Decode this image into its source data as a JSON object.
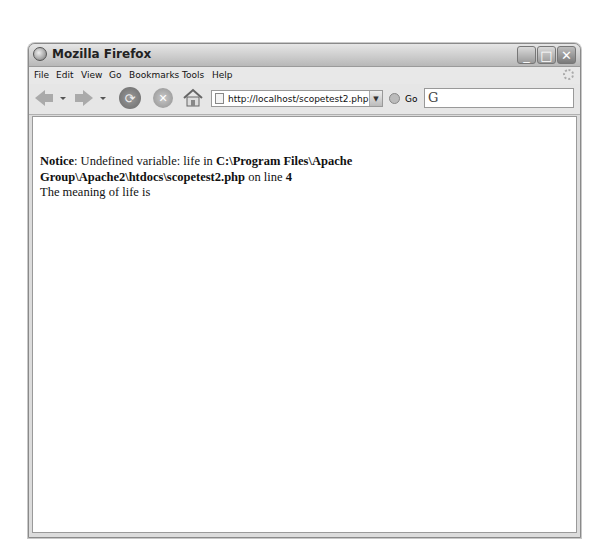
{
  "window": {
    "title": "Mozilla Firefox",
    "controls": {
      "minimize": "_",
      "maximize": "□",
      "close": "✕"
    }
  },
  "menubar": {
    "items": [
      "File",
      "Edit",
      "View",
      "Go",
      "Bookmarks",
      "Tools",
      "Help"
    ]
  },
  "navbar": {
    "url": "http://localhost/scopetest2.php",
    "go_label": "Go",
    "search_engine_glyph": "G"
  },
  "page": {
    "notice_label": "Notice",
    "notice_colon": ": Undefined variable: life in ",
    "notice_path": "C:\\Program Files\\Apache Group\\Apache2\\htdocs\\scopetest2.php",
    "notice_online": " on line ",
    "notice_line": "4",
    "output": "The meaning of life is"
  }
}
